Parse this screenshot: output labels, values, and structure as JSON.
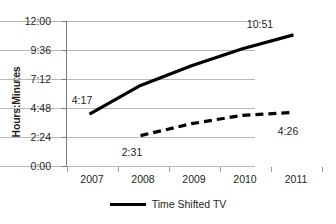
{
  "chart_data": {
    "type": "line",
    "title": "",
    "xlabel": "",
    "ylabel": "Hours:Minutes",
    "categories": [
      "2007",
      "2008",
      "2009",
      "2010",
      "2011"
    ],
    "ytick_labels": [
      "0:00",
      "2:24",
      "4:48",
      "7:12",
      "9:36",
      "12:00"
    ],
    "ytick_minutes": [
      0,
      144,
      288,
      432,
      576,
      720
    ],
    "ylim_minutes": [
      0,
      720
    ],
    "grid": true,
    "legend_position": "bottom",
    "series": [
      {
        "name": "Time Shifted TV",
        "style": "solid",
        "color": "#000000",
        "values": [
          "4:17",
          "6:40",
          "8:18",
          "9:42",
          "10:51"
        ],
        "values_minutes": [
          257,
          400,
          498,
          582,
          651
        ],
        "point_labels": [
          {
            "index": 0,
            "text": "4:17"
          },
          {
            "index": 4,
            "text": "10:51"
          }
        ]
      },
      {
        "name": "",
        "style": "dashed",
        "color": "#000000",
        "values": [
          null,
          "2:31",
          "3:30",
          "4:12",
          "4:26"
        ],
        "values_minutes": [
          null,
          151,
          210,
          252,
          266
        ],
        "point_labels": [
          {
            "index": 1,
            "text": "2:31"
          },
          {
            "index": 4,
            "text": "4:26"
          }
        ]
      }
    ]
  },
  "axis": {
    "y_title": "Hours:Minutes",
    "y_ticks": [
      {
        "label": "12:00"
      },
      {
        "label": "9:36"
      },
      {
        "label": "7:12"
      },
      {
        "label": "4:48"
      },
      {
        "label": "2:24"
      },
      {
        "label": "0:00"
      }
    ],
    "x_ticks": [
      {
        "label": "2007"
      },
      {
        "label": "2008"
      },
      {
        "label": "2009"
      },
      {
        "label": "2010"
      },
      {
        "label": "2011"
      }
    ]
  },
  "data_labels": {
    "solid_first": "4:17",
    "solid_last": "10:51",
    "dashed_first": "2:31",
    "dashed_last": "4:26"
  },
  "legend": {
    "items": [
      {
        "label": "Time Shifted TV",
        "style": "solid",
        "color": "#000000"
      }
    ]
  },
  "colors": {
    "series_line": "#000000",
    "gridline": "#b9b9b9",
    "axis": "#7b7b7b",
    "text": "#231f20",
    "background": "#ffffff"
  }
}
